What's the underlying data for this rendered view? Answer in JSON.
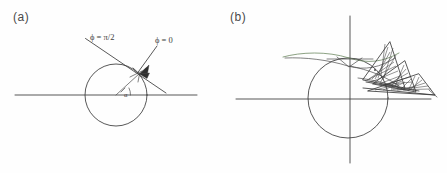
{
  "figure": {
    "background_color": "#fefefe",
    "ink_color": "#3a3a3a",
    "accent_color": "#6f8a63",
    "panels": [
      {
        "id": "a",
        "label": "(a)",
        "description": "Circle with horizontal axis and two incident rays converging to a point on the upper-right of the circle; angle alpha marked at the centre.",
        "labels": {
          "ray_phi_half_pi": "ϕ = π/2",
          "ray_phi_zero": "ϕ = 0",
          "angle": "α"
        },
        "geometry": {
          "circle_center": [
            116,
            95
          ],
          "circle_radius": 31,
          "horizontal_line": [
            15,
            95,
            197,
            95
          ],
          "contact_point": [
            139,
            74
          ],
          "ray_phi_half_pi_line": [
            86,
            39,
            165,
            92
          ],
          "ray_phi_zero_line": [
            156,
            46,
            139,
            74
          ],
          "radius_line": [
            116,
            95,
            139,
            74
          ]
        }
      },
      {
        "id": "b",
        "label": "(b)",
        "description": "Circle with horizontal and vertical axes; a caustic envelope curve above the circle and hatched fold regions to the upper right.",
        "labels": {},
        "geometry": {
          "circle_center": [
            125,
            98
          ],
          "circle_radius": 40,
          "horizontal_axis": [
            13,
            99,
            208,
            99
          ],
          "vertical_axis": [
            127,
            16,
            127,
            163
          ],
          "caustic_left_end": [
            60,
            57
          ],
          "hatch_region_right_end": [
            212,
            95
          ]
        }
      }
    ]
  }
}
